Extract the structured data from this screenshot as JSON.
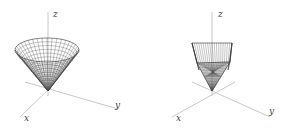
{
  "figures": [
    {
      "id": "cone",
      "surface": "full circular cone (wireframe)",
      "axis_labels": {
        "x": "x",
        "y": "y",
        "z": "z"
      }
    },
    {
      "id": "cone-section",
      "surface": "cone cut by planes (wireframe)",
      "axis_labels": {
        "x": "x",
        "y": "y",
        "z": "z"
      }
    }
  ],
  "colors": {
    "axis": "#c8c8c8",
    "mesh": "#555555",
    "label": "#444444"
  }
}
